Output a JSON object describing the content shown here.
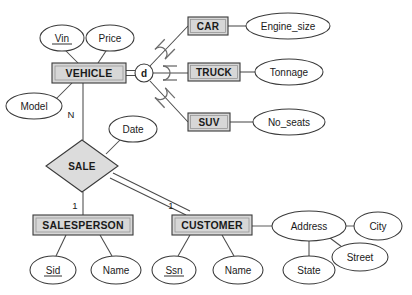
{
  "diagram": {
    "notation": "Chen ER with specialization",
    "colors": {
      "entity_fill": "#d7d7d7",
      "relationship_fill": "#dcdcdc",
      "attribute_fill": "#ffffff",
      "stroke": "#3a3a3a",
      "background": "#ffffff"
    }
  },
  "entities": {
    "vehicle": {
      "label": "VEHICLE",
      "x": 52,
      "y": 63,
      "w": 74,
      "h": 20
    },
    "car": {
      "label": "CAR",
      "x": 188,
      "y": 17,
      "w": 40,
      "h": 18
    },
    "truck": {
      "label": "TRUCK",
      "x": 188,
      "y": 63,
      "w": 52,
      "h": 18
    },
    "suv": {
      "label": "SUV",
      "x": 188,
      "y": 113,
      "w": 42,
      "h": 18
    },
    "salesperson": {
      "label": "SALESPERSON",
      "x": 33,
      "y": 215,
      "w": 100,
      "h": 20
    },
    "customer": {
      "label": "CUSTOMER",
      "x": 172,
      "y": 215,
      "w": 80,
      "h": 20
    }
  },
  "relationships": {
    "sale": {
      "label": "SALE",
      "cx": 82,
      "cy": 166,
      "rx": 36,
      "ry": 26
    }
  },
  "specialization": {
    "symbol": "d",
    "meaning": "disjoint",
    "cx": 144,
    "cy": 73,
    "r": 9
  },
  "attributes": [
    {
      "name": "vin",
      "label": "Vin",
      "cx": 62,
      "cy": 38,
      "rx": 22,
      "ry": 13,
      "key": true,
      "owner": "vehicle"
    },
    {
      "name": "price",
      "label": "Price",
      "cx": 110,
      "cy": 38,
      "rx": 24,
      "ry": 13,
      "key": false,
      "owner": "vehicle"
    },
    {
      "name": "model",
      "label": "Model",
      "cx": 34,
      "cy": 106,
      "rx": 28,
      "ry": 13,
      "key": false,
      "owner": "vehicle"
    },
    {
      "name": "engine_size",
      "label": "Engine_size",
      "cx": 288,
      "cy": 26,
      "rx": 42,
      "ry": 13,
      "key": false,
      "owner": "car"
    },
    {
      "name": "tonnage",
      "label": "Tonnage",
      "cx": 289,
      "cy": 72,
      "rx": 34,
      "ry": 13,
      "key": false,
      "owner": "truck"
    },
    {
      "name": "no_seats",
      "label": "No_seats",
      "cx": 289,
      "cy": 122,
      "rx": 36,
      "ry": 13,
      "key": false,
      "owner": "suv"
    },
    {
      "name": "date",
      "label": "Date",
      "cx": 133,
      "cy": 129,
      "rx": 24,
      "ry": 13,
      "key": false,
      "owner": "sale"
    },
    {
      "name": "sid",
      "label": "Sid",
      "cx": 53,
      "cy": 270,
      "rx": 23,
      "ry": 14,
      "key": true,
      "owner": "salesperson"
    },
    {
      "name": "sp_name",
      "label": "Name",
      "cx": 116,
      "cy": 270,
      "rx": 25,
      "ry": 14,
      "key": false,
      "owner": "salesperson"
    },
    {
      "name": "ssn",
      "label": "Ssn",
      "cx": 174,
      "cy": 270,
      "rx": 22,
      "ry": 14,
      "key": true,
      "owner": "customer"
    },
    {
      "name": "cust_name",
      "label": "Name",
      "cx": 238,
      "cy": 270,
      "rx": 25,
      "ry": 14,
      "key": false,
      "owner": "customer"
    },
    {
      "name": "address",
      "label": "Address",
      "cx": 309,
      "cy": 226,
      "rx": 37,
      "ry": 15,
      "key": false,
      "owner": "customer"
    },
    {
      "name": "city",
      "label": "City",
      "cx": 378,
      "cy": 226,
      "rx": 24,
      "ry": 14,
      "key": false,
      "owner": "address"
    },
    {
      "name": "state",
      "label": "State",
      "cx": 309,
      "cy": 270,
      "rx": 26,
      "ry": 14,
      "key": false,
      "owner": "address"
    },
    {
      "name": "street",
      "label": "Street",
      "cx": 360,
      "cy": 257,
      "rx": 28,
      "ry": 14,
      "key": false,
      "owner": "address"
    }
  ],
  "cardinalities": [
    {
      "name": "vehicle-sale-n",
      "label": "N",
      "x": 71,
      "y": 118
    },
    {
      "name": "sale-salesperson-1",
      "label": "1",
      "x": 75,
      "y": 209
    },
    {
      "name": "sale-customer-1",
      "label": "1",
      "x": 171,
      "y": 209
    }
  ]
}
